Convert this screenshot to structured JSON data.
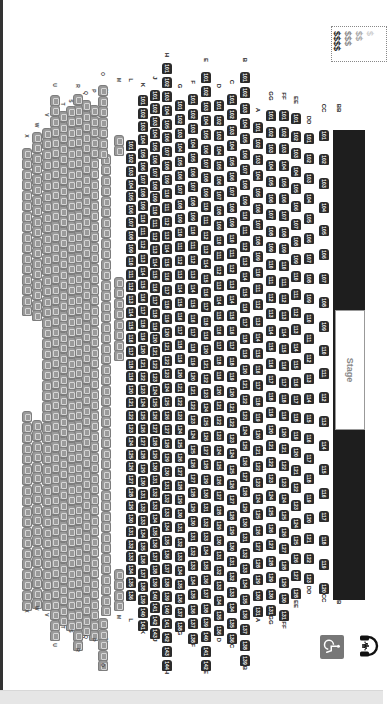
{
  "stage": {
    "label": "Stage"
  },
  "price_legend": {
    "tiers": [
      {
        "label": "$$$$",
        "color": "#222222"
      },
      {
        "label": "$$$",
        "color": "#8a8a8a"
      },
      {
        "label": "$$",
        "color": "#a8a8a8"
      },
      {
        "label": "$",
        "color": "#cfcfcf"
      }
    ]
  },
  "accessibility": {
    "wheelchair_icon": "wheelchair-icon",
    "assistive_listening_icon": "headphones-icon"
  },
  "colors": {
    "premium_seat": "#2b2b2b",
    "standard_seat": "#9a9a9a",
    "stage": "#1e1e1e"
  },
  "front_rows": [
    {
      "row": "BB",
      "x": 334,
      "seats_left": [
        119,
        118,
        117,
        116,
        115,
        114,
        113,
        112,
        111,
        110,
        109,
        108,
        107,
        106,
        105,
        104,
        103,
        102
      ],
      "y_start": 588,
      "y_end": 290,
      "label_top": 600,
      "label_bottom": 108,
      "split": false
    },
    {
      "row": "CC",
      "x": 319,
      "seats": [
        120,
        119,
        118,
        117,
        116,
        115,
        114,
        113,
        112,
        111,
        110,
        109,
        108,
        107,
        106,
        105,
        104,
        103,
        102,
        101
      ],
      "y_start": 583,
      "y_end": 130,
      "label_top": 598,
      "label_bottom": 108
    },
    {
      "row": "DD",
      "x": 304,
      "seats": [
        123,
        122,
        121,
        120,
        119,
        118,
        117,
        116,
        115,
        114,
        113,
        112,
        111,
        110,
        109,
        108,
        107,
        106,
        105,
        104,
        103,
        102,
        101
      ],
      "y_start": 573,
      "y_end": 133,
      "label_top": 590,
      "label_bottom": 120
    },
    {
      "row": "EE",
      "x": 291,
      "seats": [
        128,
        127,
        126,
        125,
        124,
        123,
        122,
        121,
        120,
        119,
        118,
        117,
        116,
        115,
        114,
        113,
        112,
        111,
        110,
        109,
        108,
        107,
        106,
        105,
        104,
        103,
        102,
        101
      ],
      "y_start": 588,
      "y_end": 113,
      "label_top": 604,
      "label_bottom": 100
    },
    {
      "row": "FF",
      "x": 279,
      "seats": [
        131,
        130,
        129,
        128,
        127,
        126,
        125,
        124,
        123,
        122,
        121,
        120,
        119,
        118,
        117,
        116,
        115,
        114,
        113,
        112,
        111,
        110,
        109,
        108,
        107,
        106,
        105,
        104,
        103,
        102,
        101
      ],
      "y_start": 610,
      "y_end": 110,
      "label_top": 625,
      "label_bottom": 96
    },
    {
      "row": "GG",
      "x": 266,
      "seats": [
        131,
        130,
        129,
        128,
        127,
        126,
        125,
        124,
        123,
        122,
        121,
        120,
        119,
        118,
        117,
        116,
        115,
        114,
        113,
        112,
        111,
        110,
        109,
        108,
        107,
        106,
        105,
        104,
        103,
        102,
        101
      ],
      "y_start": 605,
      "y_end": 110,
      "label_top": 620,
      "label_bottom": 96
    },
    {
      "row": "A",
      "x": 253,
      "seats": [
        131,
        130,
        129,
        128,
        127,
        126,
        125,
        124,
        123,
        122,
        121,
        120,
        119,
        118,
        117,
        116,
        115,
        114,
        113,
        112,
        111,
        110,
        109,
        108,
        107,
        106,
        105,
        104,
        103,
        102,
        101
      ],
      "y_start": 606,
      "y_end": 122,
      "label_top": 620,
      "label_bottom": 110
    },
    {
      "row": "B",
      "x": 240,
      "seats": [
        139,
        138,
        137,
        136,
        135,
        134,
        133,
        132,
        131,
        130,
        129,
        128,
        127,
        126,
        125,
        124,
        123,
        122,
        121,
        120,
        119,
        118,
        117,
        116,
        115,
        114,
        113,
        112,
        111,
        110,
        109,
        108,
        107,
        106,
        105,
        104,
        103,
        102,
        101
      ],
      "y_start": 655,
      "y_end": 72,
      "label_top": 668,
      "label_bottom": 60
    },
    {
      "row": "C",
      "x": 227,
      "seats": [
        136,
        135,
        134,
        133,
        132,
        131,
        130,
        129,
        128,
        127,
        126,
        125,
        124,
        123,
        122,
        121,
        120,
        119,
        118,
        117,
        116,
        115,
        114,
        113,
        112,
        111,
        110,
        109,
        108,
        107,
        106,
        105,
        104,
        103,
        102,
        101
      ],
      "y_start": 633,
      "y_end": 94,
      "label_top": 646,
      "label_bottom": 82
    },
    {
      "row": "D",
      "x": 214,
      "seats": [
        136,
        135,
        134,
        133,
        132,
        131,
        130,
        129,
        128,
        127,
        126,
        125,
        124,
        123,
        122,
        121,
        120,
        119,
        118,
        117,
        116,
        115,
        114,
        113,
        112,
        111,
        110,
        109,
        108,
        107,
        106,
        105,
        104,
        103,
        102,
        101
      ],
      "y_start": 625,
      "y_end": 100,
      "label_top": 640,
      "label_bottom": 86
    },
    {
      "row": "E",
      "x": 201,
      "seats": [
        142,
        141,
        140,
        139,
        138,
        137,
        136,
        135,
        134,
        133,
        132,
        131,
        130,
        129,
        128,
        127,
        126,
        125,
        124,
        123,
        122,
        121,
        120,
        119,
        118,
        117,
        116,
        115,
        114,
        113,
        112,
        111,
        110,
        109,
        108,
        107,
        106,
        105,
        104,
        103,
        102,
        101
      ],
      "y_start": 660,
      "y_end": 72,
      "label_top": 672,
      "label_bottom": 60
    },
    {
      "row": "F",
      "x": 188,
      "seats": [
        138,
        137,
        136,
        135,
        134,
        133,
        132,
        131,
        130,
        129,
        128,
        127,
        126,
        125,
        124,
        123,
        122,
        121,
        120,
        119,
        118,
        117,
        116,
        115,
        114,
        113,
        112,
        111,
        110,
        109,
        108,
        107,
        106,
        105,
        104,
        103,
        102,
        101
      ],
      "y_start": 633,
      "y_end": 94,
      "label_top": 645,
      "label_bottom": 82
    },
    {
      "row": "G",
      "x": 175,
      "seats": [
        138,
        137,
        136,
        135,
        134,
        133,
        132,
        131,
        130,
        129,
        128,
        127,
        126,
        125,
        124,
        123,
        122,
        121,
        120,
        119,
        118,
        117,
        116,
        115,
        114,
        113,
        112,
        111,
        110,
        109,
        108,
        107,
        106,
        105,
        104,
        103,
        102,
        101
      ],
      "y_start": 621,
      "y_end": 100,
      "label_top": 633,
      "label_bottom": 86
    },
    {
      "row": "H",
      "x": 162,
      "seats": [
        144,
        143,
        142,
        141,
        140,
        139,
        138,
        137,
        136,
        135,
        134,
        133,
        132,
        131,
        130,
        129,
        128,
        127,
        126,
        125,
        124,
        123,
        122,
        121,
        120,
        119,
        118,
        117,
        116,
        115,
        114,
        113,
        112,
        111,
        110,
        109,
        108,
        107,
        106,
        105,
        104,
        103,
        102,
        101
      ],
      "y_start": 660,
      "y_end": 63,
      "label_top": 672,
      "label_bottom": 55
    },
    {
      "row": "J",
      "x": 150,
      "seats": [
        143,
        142,
        141,
        140,
        139,
        138,
        137,
        136,
        135,
        134,
        133,
        132,
        131,
        130,
        129,
        128,
        127,
        126,
        125,
        124,
        123,
        122,
        121,
        120,
        119,
        118,
        117,
        116,
        115,
        114,
        113,
        112,
        111,
        110,
        109,
        108,
        107,
        106,
        105,
        104,
        103,
        102,
        101
      ],
      "y_start": 628,
      "y_end": 90,
      "label_top": 640,
      "label_bottom": 78
    },
    {
      "row": "K",
      "x": 138,
      "seats": [
        141,
        140,
        139,
        138,
        137,
        136,
        135,
        134,
        133,
        132,
        131,
        130,
        129,
        128,
        127,
        126,
        125,
        124,
        123,
        122,
        121,
        120,
        119,
        118,
        117,
        116,
        115,
        114,
        113,
        112,
        111,
        110,
        109,
        108,
        107,
        106,
        105,
        104,
        103,
        102,
        101
      ],
      "y_start": 620,
      "y_end": 95,
      "label_top": 632,
      "label_bottom": 85
    },
    {
      "row": "L",
      "x": 126,
      "seats": [
        136,
        135,
        134,
        133,
        132,
        131,
        130,
        129,
        128,
        127,
        126,
        125,
        124,
        123,
        122,
        121,
        120,
        119,
        118,
        117,
        116,
        115,
        114,
        113,
        112,
        111,
        110,
        109,
        108,
        107,
        106,
        105,
        104,
        103,
        102,
        101
      ],
      "y_start": 590,
      "y_end": 140,
      "label_top": 620,
      "label_bottom": 80
    }
  ],
  "rear_rows": [
    {
      "row": "M",
      "x": 114,
      "segments": [
        [
          600,
          560
        ],
        [
          350,
          275
        ],
        [
          145,
          130
        ]
      ],
      "label_top": 617,
      "label_bottom": 80
    },
    {
      "row": "N",
      "x": 101,
      "segments": [
        [
          605,
          150
        ]
      ],
      "label_top": 640,
      "label_bottom": 91
    },
    {
      "row": "O",
      "x": 98,
      "segments": [
        [
          660,
          608
        ],
        [
          148,
          80
        ]
      ],
      "label_top": 665,
      "label_bottom": 74
    },
    {
      "row": "P",
      "x": 89,
      "segments": [
        [
          630,
          95
        ]
      ],
      "label_top": 640,
      "label_bottom": 91
    },
    {
      "row": "Q",
      "x": 81,
      "segments": [
        [
          625,
          98
        ]
      ],
      "label_top": 637,
      "label_bottom": 93
    },
    {
      "row": "R",
      "x": 73,
      "segments": [
        [
          640,
          90
        ]
      ],
      "label_top": 650,
      "label_bottom": 86
    },
    {
      "row": "S",
      "x": 66,
      "segments": [
        [
          620,
          105
        ]
      ],
      "label_top": 631,
      "label_bottom": 101
    },
    {
      "row": "T",
      "x": 58,
      "segments": [
        [
          615,
          110
        ]
      ],
      "label_top": 627,
      "label_bottom": 104
    },
    {
      "row": "U",
      "x": 50,
      "segments": [
        [
          630,
          90
        ]
      ],
      "label_top": 645,
      "label_bottom": 85
    },
    {
      "row": "V",
      "x": 42,
      "segments": [
        [
          600,
          125
        ]
      ],
      "label_top": 615,
      "label_bottom": 115
    },
    {
      "row": "W",
      "x": 32,
      "segments": [
        [
          598,
          410
        ],
        [
          310,
          130
        ]
      ],
      "label_top": 608,
      "label_bottom": 125
    },
    {
      "row": "X",
      "x": 22,
      "segments": [
        [
          600,
          410
        ],
        [
          305,
          143
        ]
      ],
      "label_top": 611,
      "label_bottom": 136
    }
  ]
}
